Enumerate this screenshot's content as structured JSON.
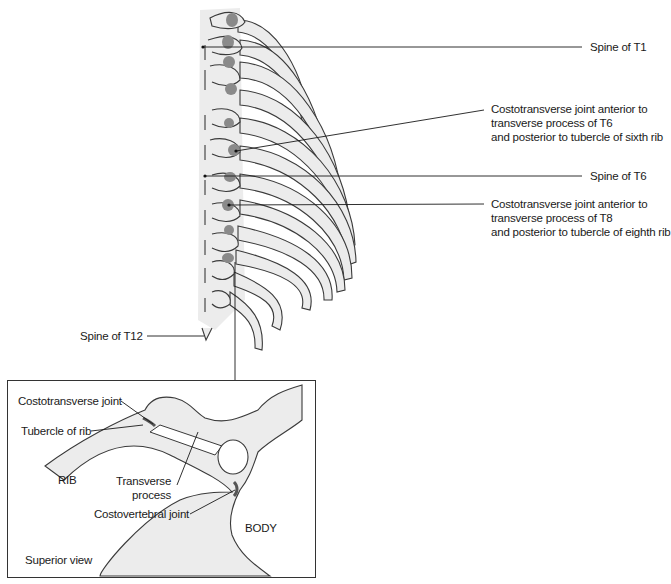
{
  "labels": {
    "spine_t1": "Spine of T1",
    "ctj_t6": [
      "Costotransverse joint anterior to",
      "transverse process of T6",
      "and posterior to tubercle of sixth rib"
    ],
    "spine_t6": "Spine of T6",
    "ctj_t8": [
      "Costotransverse joint anterior to",
      "transverse process of T8",
      "and posterior to tubercle of eighth rib"
    ],
    "spine_t12": "Spine of T12"
  },
  "inset": {
    "costotransverse_joint": "Costotransverse joint",
    "tubercle_of_rib": "Tubercle of rib",
    "rib": "RIB",
    "transverse_process": [
      "Transverse",
      "process"
    ],
    "costovertebral_joint": "Costovertebral joint",
    "body": "BODY",
    "view": "Superior view"
  },
  "colors": {
    "bone_fill": "#ececec",
    "joint_fill": "#8a8a8a",
    "outline": "#3a3a3a"
  }
}
